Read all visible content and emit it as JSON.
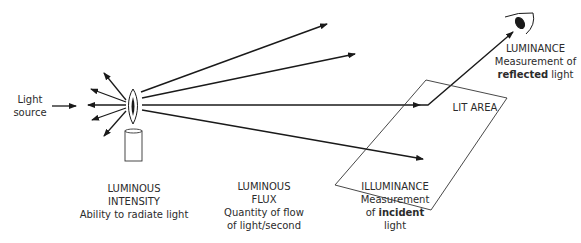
{
  "diagram": {
    "type": "photometry-concepts",
    "colors": {
      "line": "#1a1a1a",
      "thin_line": "#333333",
      "text": "#2b2b2b",
      "background": "#ffffff"
    },
    "labels": {
      "light_source": {
        "line1": "Light",
        "line2": "source"
      },
      "luminous_intensity": {
        "title1": "LUMINOUS",
        "title2": "INTENSITY",
        "desc": "Ability to radiate light"
      },
      "luminous_flux": {
        "title1": "LUMINOUS",
        "title2": "FLUX",
        "desc1": "Quantity of flow",
        "desc2": "of light/second"
      },
      "illuminance": {
        "title": "ILLUMINANCE",
        "desc1": "Measurement",
        "desc2_pre": "of ",
        "desc2_bold": "incident",
        "desc3": "light"
      },
      "luminance": {
        "title": "LUMINANCE",
        "desc1": "Measurement of",
        "desc2_bold": "reflected",
        "desc2_post": " light"
      },
      "lit_area": "LIT AREA"
    },
    "icons": [
      "candle-icon",
      "flame-icon",
      "eye-icon"
    ]
  }
}
